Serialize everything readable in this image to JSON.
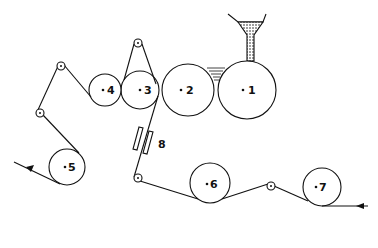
{
  "diagram": {
    "line_color": "#111111",
    "background": "#ffffff",
    "rolls": [
      {
        "id": "1",
        "label": "1",
        "cx": 247,
        "cy": 90,
        "r": 29
      },
      {
        "id": "2",
        "label": "2",
        "cx": 188,
        "cy": 90,
        "r": 26
      },
      {
        "id": "3",
        "label": "3",
        "cx": 140,
        "cy": 90,
        "r": 19
      },
      {
        "id": "4",
        "label": "4",
        "cx": 105,
        "cy": 90,
        "r": 16
      },
      {
        "id": "5",
        "label": "5",
        "cx": 67,
        "cy": 167,
        "r": 18
      },
      {
        "id": "6",
        "label": "6",
        "cx": 210,
        "cy": 183,
        "r": 20
      },
      {
        "id": "7",
        "label": "7",
        "cx": 322,
        "cy": 187,
        "r": 19
      }
    ],
    "guides": [
      {
        "cx": 138,
        "cy": 43
      },
      {
        "cx": 61,
        "cy": 66
      },
      {
        "cx": 40,
        "cy": 113
      },
      {
        "cx": 138,
        "cy": 178
      },
      {
        "cx": 271,
        "cy": 186
      }
    ],
    "plates_label": "8",
    "hopper": {
      "fill": "#bbbbbb"
    }
  }
}
